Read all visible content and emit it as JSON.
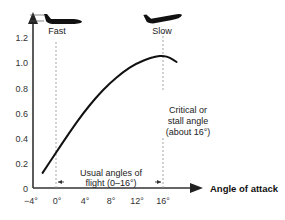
{
  "chart_data": {
    "type": "line",
    "title": "",
    "xlabel": "Angle of attack",
    "ylabel": "",
    "x_unit": "degrees",
    "xlim": [
      -4,
      18
    ],
    "ylim": [
      0,
      1.25
    ],
    "x_ticks": [
      "−4°",
      "0°",
      "4°",
      "8°",
      "12°",
      "16°"
    ],
    "x_tick_values": [
      -4,
      0,
      4,
      8,
      12,
      16
    ],
    "y_ticks": [
      "0",
      "0.2",
      "0.4",
      "0.6",
      "0.8",
      "1.0",
      "1.2"
    ],
    "y_tick_values": [
      0,
      0.2,
      0.4,
      0.6,
      0.8,
      1.0,
      1.2
    ],
    "grid": false,
    "series": [
      {
        "name": "Lift coefficient",
        "x": [
          -2,
          0,
          2,
          4,
          6,
          8,
          10,
          12,
          14,
          15,
          16,
          17,
          18
        ],
        "values": [
          0.12,
          0.28,
          0.44,
          0.59,
          0.72,
          0.83,
          0.92,
          0.99,
          1.03,
          1.045,
          1.05,
          1.035,
          1.0
        ]
      }
    ],
    "annotations": [
      {
        "text": "Fast",
        "x": 0,
        "position": "top"
      },
      {
        "text": "Slow",
        "x": 16,
        "position": "top"
      },
      {
        "text": "Critical or",
        "line2": "stall angle",
        "line3": "(about 16°)",
        "x": 16
      },
      {
        "text": "Usual angles of",
        "line2": "flight (0–16°)",
        "range": [
          0,
          16
        ]
      }
    ],
    "reference_lines": [
      {
        "x": 0,
        "style": "dotted"
      },
      {
        "x": 16,
        "style": "dotted"
      }
    ]
  },
  "labels": {
    "fast": "Fast",
    "slow": "Slow",
    "critical_1": "Critical or",
    "critical_2": "stall angle",
    "critical_3": "(about 16°)",
    "usual_1": "Usual angles of",
    "usual_2": "flight (0–16°)",
    "x_axis": "Angle of attack"
  },
  "icons": {
    "fast_plane": "airplane-level-icon",
    "slow_plane": "airplane-nose-up-icon"
  },
  "colors": {
    "line": "#111111",
    "axis": "#333333",
    "reference": "#888888",
    "plane": "#111111"
  }
}
